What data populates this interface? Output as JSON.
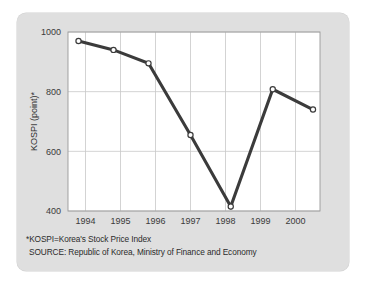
{
  "figure": {
    "background_color": "#dfdfdf",
    "plot_background_color": "#ffffff",
    "line_color": "#3b3b3b",
    "grid_color": "#c8c8c8",
    "marker_fill": "#ffffff"
  },
  "footnotes": {
    "definition": "*KOSPI=Korea's Stock Price Index",
    "source": "SOURCE: Republic of Korea, Ministry of Finance and Economy"
  },
  "chart_data": {
    "type": "line",
    "title": "",
    "xlabel": "",
    "ylabel": "KOSPI (point)*",
    "x": [
      1993.8,
      1994.8,
      1995.8,
      1997.0,
      1998.15,
      1999.35,
      2000.5
    ],
    "values": [
      970,
      940,
      895,
      655,
      415,
      808,
      740
    ],
    "xtick_labels": [
      "1994",
      "1995",
      "1996",
      "1997",
      "1998",
      "1999",
      "2000"
    ],
    "xtick_values": [
      1994,
      1995,
      1996,
      1997,
      1998,
      1999,
      2000
    ],
    "ytick_labels": [
      "400",
      "600",
      "800",
      "1000"
    ],
    "ytick_values": [
      400,
      600,
      800,
      1000
    ],
    "xlim": [
      1993.5,
      2000.7
    ],
    "ylim": [
      400,
      1000
    ],
    "grid": true,
    "legend": "none",
    "markers": "open-circle"
  }
}
